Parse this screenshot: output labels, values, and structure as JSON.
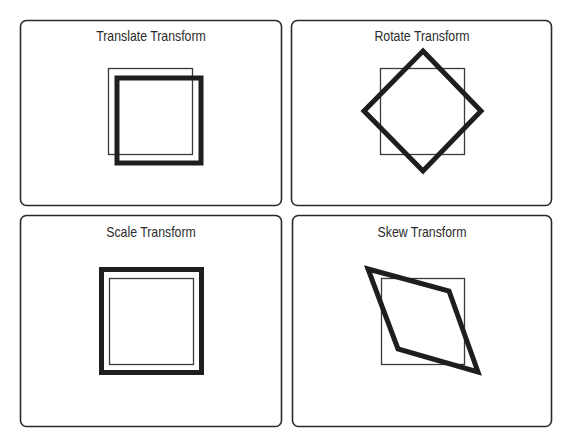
{
  "colors": {
    "panel_border": "#2a2a2a",
    "original_shape": "#3a3a3a",
    "transformed_shape": "#1e1e1e",
    "title_text": "#2b2b2b",
    "background": "#ffffff"
  },
  "panels": [
    {
      "id": "translate",
      "title": "Translate Transform",
      "transform": {
        "type": "translate",
        "dx": 7,
        "dy": 8
      }
    },
    {
      "id": "rotate",
      "title": "Rotate Transform",
      "transform": {
        "type": "rotate",
        "angle_deg": 45
      }
    },
    {
      "id": "scale",
      "title": "Scale Transform",
      "transform": {
        "type": "scale",
        "factor": 1.2
      }
    },
    {
      "id": "skew",
      "title": "Skew Transform",
      "transform": {
        "type": "skew",
        "skew_x_deg": -20,
        "skew_y_deg": 15
      }
    }
  ]
}
